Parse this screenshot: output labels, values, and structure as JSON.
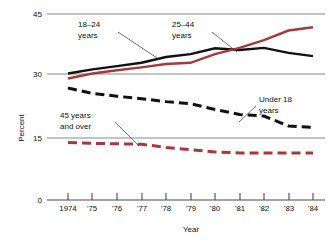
{
  "chart_data": {
    "type": "line",
    "title": "",
    "xlabel": "Year",
    "ylabel": "Percent",
    "x": [
      1974,
      1975,
      1976,
      1977,
      1978,
      1979,
      1980,
      1981,
      1982,
      1983,
      1984
    ],
    "xtick_labels": [
      "1974",
      "'75",
      "'76",
      "'77",
      "'78",
      "'79",
      "'80",
      "'81",
      "'82",
      "'83",
      "'84"
    ],
    "ytick_labels": [
      "0",
      "15",
      "30",
      "45"
    ],
    "ytick_values": [
      0,
      15,
      30,
      45
    ],
    "ylim": [
      0,
      45
    ],
    "xlim": [
      1974,
      1984
    ],
    "grid": "horizontal",
    "legend_position": "inline-annotations",
    "series": [
      {
        "name": "18-24 years",
        "label": "18–24",
        "label_line2": "years",
        "color": "#111111",
        "style": "solid",
        "values": [
          30.6,
          31.6,
          32.4,
          33.2,
          34.6,
          35.3,
          36.7,
          36.3,
          36.8,
          35.6,
          34.8
        ]
      },
      {
        "name": "25-44 years",
        "label": "25–44",
        "label_line2": "years",
        "color": "#a8383a",
        "style": "solid",
        "values": [
          29.4,
          30.6,
          31.4,
          32.1,
          32.9,
          33.2,
          35.3,
          36.8,
          38.7,
          41.0,
          41.8
        ]
      },
      {
        "name": "Under 18 years",
        "label": "Under 18",
        "label_line2": "years",
        "color": "#111111",
        "style": "dashed",
        "values": [
          27.1,
          25.8,
          25.1,
          24.5,
          23.8,
          23.3,
          21.9,
          20.7,
          20.3,
          17.9,
          17.6
        ]
      },
      {
        "name": "45 years and over",
        "label": "45 years",
        "label_line2": "and over",
        "color": "#a8383a",
        "style": "dashed",
        "values": [
          13.9,
          13.7,
          13.6,
          13.5,
          12.7,
          12.2,
          11.6,
          11.4,
          11.4,
          11.4,
          11.4
        ]
      }
    ],
    "annotations": [
      {
        "id": "annot-18-24",
        "line1": "18–24",
        "line2": "years"
      },
      {
        "id": "annot-25-44",
        "line1": "25–44",
        "line2": "years"
      },
      {
        "id": "annot-under-18",
        "line1": "Under 18",
        "line2": "years"
      },
      {
        "id": "annot-45-over",
        "line1": "45 years",
        "line2": "and over"
      }
    ]
  }
}
